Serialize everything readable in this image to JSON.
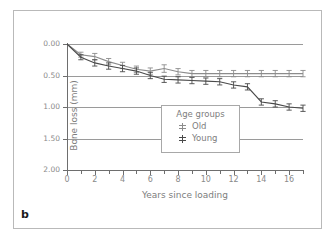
{
  "panel": {
    "label": "b"
  },
  "chart_data": {
    "type": "line",
    "title": "",
    "xlabel": "Years since loading",
    "ylabel": "Bone loss (mm)",
    "xlim": [
      0,
      17
    ],
    "ylim": [
      0.0,
      2.0
    ],
    "y_inverted": true,
    "grid": true,
    "legend_position": "center",
    "legend_title": "Age groups",
    "xticks": [
      0,
      1,
      2,
      3,
      4,
      5,
      6,
      7,
      8,
      9,
      10,
      11,
      12,
      13,
      14,
      15,
      16,
      17
    ],
    "xtick_labels": [
      "0",
      "",
      "2",
      "",
      "4",
      "",
      "6",
      "",
      "8",
      "",
      "10",
      "",
      "12",
      "",
      "14",
      "",
      "16",
      ""
    ],
    "yticks": [
      0.0,
      0.5,
      1.0,
      1.5,
      2.0
    ],
    "ytick_labels": [
      "0.00",
      "0.50",
      "1.00",
      "1.50",
      "2.00"
    ],
    "x": [
      0,
      1,
      2,
      3,
      4,
      5,
      6,
      7,
      8,
      9,
      10,
      11,
      12,
      13,
      14,
      15,
      16,
      17
    ],
    "series": [
      {
        "name": "Old",
        "color": "#8c8c8c",
        "marker": "errorbar",
        "values": [
          0.0,
          0.17,
          0.2,
          0.28,
          0.34,
          0.4,
          0.43,
          0.39,
          0.44,
          0.47,
          0.47,
          0.47,
          0.47,
          0.47,
          0.47,
          0.47,
          0.47,
          0.47
        ],
        "errors": [
          0.0,
          0.04,
          0.05,
          0.05,
          0.05,
          0.05,
          0.05,
          0.06,
          0.05,
          0.05,
          0.05,
          0.05,
          0.05,
          0.05,
          0.05,
          0.05,
          0.05,
          0.05
        ]
      },
      {
        "name": "Young",
        "color": "#4a4a4a",
        "marker": "errorbar",
        "values": [
          0.0,
          0.21,
          0.3,
          0.35,
          0.39,
          0.43,
          0.5,
          0.56,
          0.57,
          0.58,
          0.59,
          0.6,
          0.65,
          0.68,
          0.92,
          0.95,
          1.0,
          1.02
        ],
        "errors": [
          0.0,
          0.04,
          0.05,
          0.05,
          0.05,
          0.05,
          0.05,
          0.05,
          0.05,
          0.05,
          0.05,
          0.05,
          0.05,
          0.05,
          0.05,
          0.05,
          0.05,
          0.05
        ]
      }
    ]
  }
}
